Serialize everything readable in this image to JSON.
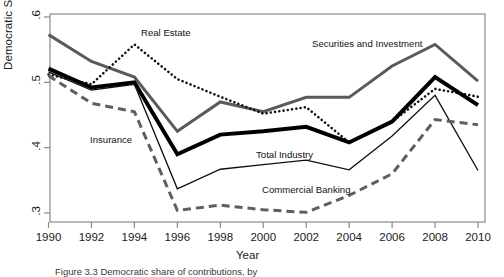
{
  "figure": {
    "caption_prefix": "Figure 3.3",
    "caption_text": "Figure 3.3  Democratic share of contributions, by"
  },
  "chart_data": {
    "type": "line",
    "title": "",
    "xlabel": "Year",
    "ylabel": "Democratic Share",
    "xlim": [
      1990,
      2010
    ],
    "ylim": [
      0.3,
      0.6
    ],
    "xticks": [
      1990,
      1992,
      1994,
      1996,
      1998,
      2000,
      2002,
      2004,
      2006,
      2008,
      2010
    ],
    "xtick_labels": [
      "1990",
      "1992",
      "1994",
      "1996",
      "1998",
      "2000",
      "2002",
      "2004",
      "2006",
      "2008",
      "2010"
    ],
    "yticks": [
      0.3,
      0.4,
      0.5,
      0.6
    ],
    "ytick_labels": [
      ".3",
      ".4",
      ".5",
      ".6"
    ],
    "grid": false,
    "legend": "inline-annotations",
    "x": [
      1990,
      1992,
      1994,
      1996,
      1998,
      2000,
      2002,
      2004,
      2006,
      2008,
      2010
    ],
    "series": [
      {
        "name": "Securities and Investment",
        "style": "solid-thick-gray",
        "color": "#5a5a5a",
        "values": [
          0.573,
          0.532,
          0.508,
          0.425,
          0.47,
          0.455,
          0.477,
          0.477,
          0.525,
          0.558,
          0.502
        ],
        "label_x": 312,
        "label_y": 38
      },
      {
        "name": "Real Estate",
        "style": "dotted-black",
        "color": "#141414",
        "values": [
          0.512,
          0.497,
          0.558,
          0.505,
          0.478,
          0.452,
          0.462,
          0.408,
          0.44,
          0.49,
          0.478
        ],
        "label_x": 141,
        "label_y": 27
      },
      {
        "name": "Total Industry",
        "style": "solid-extrathick-black",
        "color": "#000000",
        "values": [
          0.521,
          0.492,
          0.5,
          0.39,
          0.42,
          0.425,
          0.432,
          0.408,
          0.44,
          0.508,
          0.465
        ],
        "label_x": 256,
        "label_y": 149
      },
      {
        "name": "Commercial Banking",
        "style": "solid-thin-black",
        "color": "#0f0f0f",
        "values": [
          0.516,
          0.488,
          0.497,
          0.337,
          0.367,
          0.374,
          0.381,
          0.366,
          0.418,
          0.48,
          0.365
        ],
        "label_x": 262,
        "label_y": 184
      },
      {
        "name": "Insurance",
        "style": "dashed-gray",
        "color": "#5f5f5f",
        "values": [
          0.51,
          0.468,
          0.455,
          0.304,
          0.312,
          0.305,
          0.301,
          0.327,
          0.36,
          0.443,
          0.435
        ],
        "label_x": 90,
        "label_y": 134
      }
    ]
  }
}
